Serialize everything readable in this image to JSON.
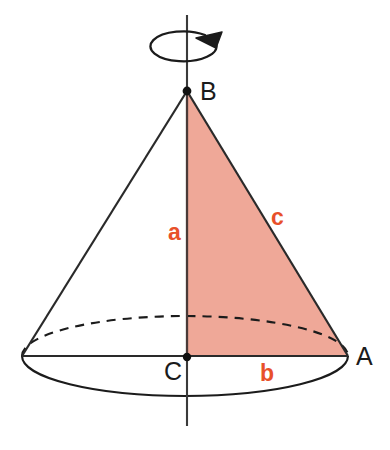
{
  "diagram": {
    "background_color": "#ffffff",
    "stroke_color": "#1b1b1b",
    "fill_color": "#efa898",
    "label_color_sides": "#e8502a",
    "label_color_vertices": "#1b1b1b",
    "vertices": [
      {
        "id": "B",
        "label": "B",
        "role": "apex",
        "x": 187,
        "y": 91
      },
      {
        "id": "C",
        "label": "C",
        "role": "base-center",
        "x": 187,
        "y": 357
      },
      {
        "id": "A",
        "label": "A",
        "role": "base-rim-right",
        "x": 348,
        "y": 356
      }
    ],
    "sides": [
      {
        "id": "a",
        "label": "a",
        "from": "B",
        "to": "C",
        "meaning": "height",
        "x": 175,
        "y": 233
      },
      {
        "id": "b",
        "label": "b",
        "from": "C",
        "to": "A",
        "meaning": "base-radius",
        "x": 266,
        "y": 374
      },
      {
        "id": "c",
        "label": "c",
        "from": "B",
        "to": "A",
        "meaning": "slant-height",
        "x": 278,
        "y": 218
      }
    ],
    "shaded_region": {
      "name": "right-triangle-BCA",
      "fill": "#efa898",
      "points": "187,91 187,357 348,356"
    },
    "base_ellipse": {
      "center_x": 185,
      "center_y": 356,
      "radius_x": 163,
      "radius_y": 40,
      "front_arc": "solid",
      "back_arc": "dashed"
    },
    "axis": {
      "name": "axis-of-rotation",
      "x": 187,
      "y_top": 15,
      "y_bottom": 426,
      "style": "solid"
    },
    "rotation_arrow": {
      "name": "rotation-arrow",
      "center_x": 185,
      "center_y": 47,
      "radius_x": 33,
      "radius_y": 15,
      "direction": "clockwise-from-above"
    },
    "left_slant_edge": {
      "from": "B",
      "to_x": 22,
      "to_y": 356
    },
    "base_diameter_line": {
      "from_x": 22,
      "from_y": 356,
      "to_x": 348,
      "to_y": 356
    }
  }
}
